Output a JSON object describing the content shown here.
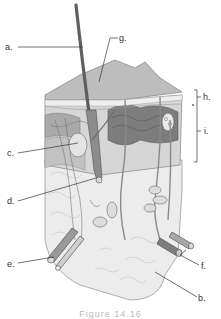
{
  "diagram": {
    "labels": {
      "a": "a.",
      "b": "b.",
      "c": "c.",
      "d": "d.",
      "e": "e.",
      "f": "f.",
      "g": "g.",
      "h": "h.",
      "i": "i."
    },
    "caption": "Figure 14.16",
    "colors": {
      "hair": "#6e6e6e",
      "surface": "#b5b5b5",
      "dermis": "#cfcfcf",
      "dark_layer": "#7a7a7a",
      "fat": "#e6e6e6",
      "outline": "#8a8a8a",
      "leader_line": "#333333"
    }
  }
}
